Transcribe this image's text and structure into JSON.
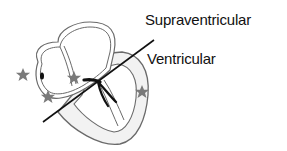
{
  "diagram": {
    "labels": {
      "supraventricular": "Supraventricular",
      "ventricular": "Ventricular"
    },
    "colors": {
      "outline": "#6a6a6a",
      "fill": "#f2f2f2",
      "line": "#111111",
      "star": "#7a7a7a",
      "conduction": "#111111"
    },
    "stars": [
      {
        "name": "star-left-atrium-outside",
        "x": 23,
        "y": 75
      },
      {
        "name": "star-atrium-bottom",
        "x": 48,
        "y": 97
      },
      {
        "name": "star-av-node",
        "x": 74,
        "y": 78
      },
      {
        "name": "star-ventricle-wall",
        "x": 142,
        "y": 92
      }
    ]
  }
}
